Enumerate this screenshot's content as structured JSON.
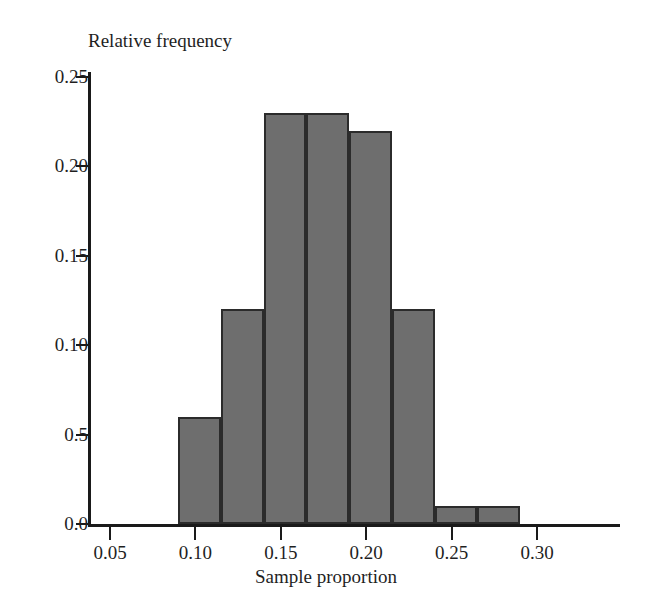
{
  "chart_data": {
    "type": "bar",
    "title": "",
    "xlabel": "Sample proportion",
    "ylabel": "Relative frequency",
    "grid": false,
    "legend": "none",
    "xlim": [
      0.035,
      0.335
    ],
    "ylim": [
      0.0,
      0.25
    ],
    "bin_width": 0.025,
    "x_tick_labels": [
      "0.05",
      "0.10",
      "0.15",
      "0.20",
      "0.25",
      "0.30"
    ],
    "x_tick_values": [
      0.05,
      0.1,
      0.15,
      0.2,
      0.25,
      0.3
    ],
    "y_tick_labels": [
      "0.25",
      "0.20",
      "0.15",
      "0.10",
      "0.5",
      "0.0"
    ],
    "y_tick_values": [
      0.25,
      0.2,
      0.15,
      0.1,
      0.05,
      0.0
    ],
    "categories": [
      "0.090-0.115",
      "0.115-0.140",
      "0.140-0.165",
      "0.165-0.190",
      "0.190-0.215",
      "0.215-0.240",
      "0.240-0.265",
      "0.265-0.290"
    ],
    "bin_starts": [
      0.09,
      0.115,
      0.14,
      0.165,
      0.19,
      0.215,
      0.24,
      0.265
    ],
    "bin_ends": [
      0.115,
      0.14,
      0.165,
      0.19,
      0.215,
      0.24,
      0.265,
      0.29
    ],
    "values": [
      0.06,
      0.12,
      0.23,
      0.23,
      0.22,
      0.12,
      0.01,
      0.01
    ],
    "bar_color": "#6e6e6e",
    "bar_edge_color": "#2b2b2b",
    "axis_color": "#1a1a1a"
  }
}
